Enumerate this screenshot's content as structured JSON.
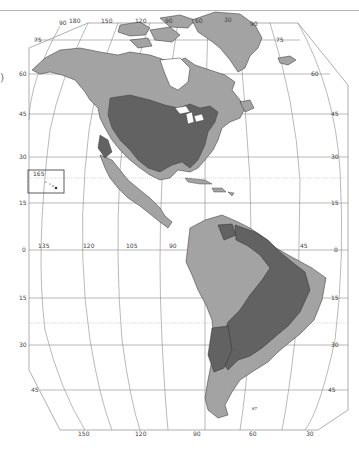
{
  "map": {
    "title": "",
    "region": "The Americas",
    "edge_glyph": ")",
    "colors": {
      "background": "#ffffff",
      "land_light": "#a3a3a3",
      "land_dark": "#626262",
      "outline": "#2e2e2e",
      "graticule": "#8c8c8c",
      "frame": "#9a9a9a",
      "label": "#444444"
    },
    "legend_shades": [
      {
        "name": "light-gray-land",
        "color": "#a3a3a3"
      },
      {
        "name": "dark-gray-land",
        "color": "#626262"
      }
    ],
    "top_longitude_labels": [
      "90",
      "180",
      "150",
      "120",
      "90",
      "60",
      "30",
      "90"
    ],
    "left_latitude_labels": [
      "75",
      "60",
      "45",
      "30",
      "15",
      "0",
      "15",
      "30",
      "45"
    ],
    "right_latitude_labels": [
      "75",
      "60",
      "45",
      "30",
      "15",
      "0",
      "15",
      "30",
      "45"
    ],
    "equator_longitude_labels": [
      "135",
      "120",
      "105",
      "90",
      "45"
    ],
    "bottom_longitude_labels": [
      "150",
      "120",
      "90",
      "60",
      "30"
    ],
    "inset": {
      "label": "165",
      "name": "Hawaii"
    },
    "south_marker": "67"
  }
}
